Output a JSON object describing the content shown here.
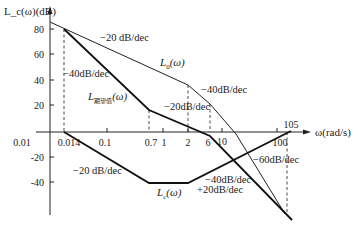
{
  "diagram": {
    "type": "bode-magnitude-asymptotic",
    "y_axis_label": "L_c(ω)(dB)",
    "x_axis_label": "ω(rad/s)",
    "y_ticks": [
      "80",
      "60",
      "40",
      "20",
      "-20",
      "-40"
    ],
    "x_ticks": [
      "0.01",
      "0.014",
      "0.1",
      "0.7",
      "1",
      "2",
      "6",
      "10",
      "100",
      "105"
    ],
    "curves": [
      {
        "name": "L0(ω)",
        "label": "L₀(ω)",
        "points": [
          [
            0.008,
            86
          ],
          [
            2,
            36
          ],
          [
            6,
            17
          ],
          [
            100,
            -56
          ]
        ]
      },
      {
        "name": "L_desired(ω)",
        "label": "L期望值(ω)",
        "points": [
          [
            0.014,
            80
          ],
          [
            0.7,
            17
          ],
          [
            6,
            -2
          ],
          [
            105,
            -58
          ]
        ]
      },
      {
        "name": "Lc(ω)",
        "label": "Lc(ω)",
        "points": [
          [
            0.014,
            0
          ],
          [
            0.7,
            -40
          ],
          [
            2,
            -40
          ],
          [
            105,
            0
          ]
        ]
      }
    ],
    "annotations": [
      "−20 dB/dec",
      "−40dB/dec",
      "−40dB/dec",
      "−20dB/dec",
      "−60dB/dec",
      "−20 dB/dec",
      "−40dB/dec",
      "+20dB/dec"
    ],
    "curve_labels": {
      "l0": "L",
      "l0_sub": "0",
      "ld": "L",
      "ld_sub": "期望值",
      "lc": "L",
      "lc_sub": "c",
      "omega": "(ω)"
    }
  }
}
